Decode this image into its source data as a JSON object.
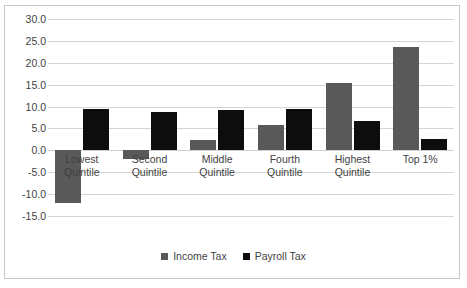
{
  "chart_data": {
    "type": "bar",
    "title": "",
    "subtitle": "",
    "xlabel": "",
    "ylabel": "",
    "categories": [
      "Lowest Quintile",
      "Second Quintile",
      "Middle Quintile",
      "Fourth Quintile",
      "Highest Quintile",
      "Top 1%"
    ],
    "category_lines": [
      [
        "Lowest",
        "Quintile"
      ],
      [
        "Second",
        "Quintile"
      ],
      [
        "Middle",
        "Quintile"
      ],
      [
        "Fourth",
        "Quintile"
      ],
      [
        "Highest",
        "Quintile"
      ],
      [
        "Top 1%",
        ""
      ]
    ],
    "series": [
      {
        "name": "Income Tax",
        "color": "#595959",
        "values": [
          -12.0,
          -2.0,
          2.3,
          5.9,
          15.3,
          23.7
        ]
      },
      {
        "name": "Payroll Tax",
        "color": "#0d0d0d",
        "values": [
          9.5,
          8.7,
          9.1,
          9.4,
          6.6,
          2.6
        ]
      }
    ],
    "ylim": [
      -15.0,
      30.0
    ],
    "yticks": [
      30.0,
      25.0,
      20.0,
      15.0,
      10.0,
      5.0,
      0.0,
      -5.0,
      -10.0,
      -15.0
    ],
    "ytick_labels": [
      "30.0",
      "25.0",
      "20.0",
      "15.0",
      "10.0",
      "5.0",
      "0.0",
      "-5.0",
      "-10.0",
      "-15.0"
    ],
    "grid": true,
    "legend_position": "bottom",
    "legend_entries": [
      "Income Tax",
      "Payroll Tax"
    ]
  },
  "colors": {
    "income_tax": "#595959",
    "payroll_tax": "#0d0d0d",
    "gridline": "#d4d4d4",
    "border": "#c9c9c9",
    "text": "#3f3f3f"
  }
}
